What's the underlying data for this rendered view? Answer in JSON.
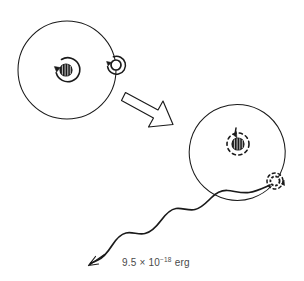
{
  "figure": {
    "kind": "atomic-transition-diagram",
    "background_color": "#ffffff",
    "ink_color": "#1a1a1a",
    "text_color": "#4a4a4a",
    "caption_label": "9.5 × 10",
    "caption_exponent": "−18",
    "caption_unit": " erg",
    "caption_full": "9.5 × 10−18 erg"
  },
  "initial_atom": {
    "name": "excited-atom",
    "orbit": {
      "cx": 67,
      "cy": 70,
      "r": 49
    },
    "nucleus": {
      "cx": 66,
      "cy": 70,
      "r": 6
    },
    "nucleus_spin_ring": {
      "cx": 66,
      "cy": 70,
      "r": 12
    },
    "electron": {
      "cx": 116,
      "cy": 65,
      "r": 5
    },
    "electron_spin_ring": {
      "cx": 116,
      "cy": 65,
      "r": 9
    },
    "style": "solid"
  },
  "final_atom": {
    "name": "ground-state-atom",
    "orbit": {
      "cx": 240,
      "cy": 150,
      "r": 48
    },
    "nucleus": {
      "cx": 238,
      "cy": 144,
      "r": 6
    },
    "nucleus_spin_ring": {
      "cx": 238,
      "cy": 144,
      "r": 11
    },
    "electron": {
      "cx": 275,
      "cy": 181,
      "r": 5
    },
    "electron_spin_ring": {
      "cx": 275,
      "cy": 181,
      "r": 8
    },
    "style": "dashed"
  },
  "transition_arrow": {
    "name": "block-arrow",
    "direction": "down-right",
    "from": {
      "x": 124,
      "y": 93
    },
    "to": {
      "x": 172,
      "y": 128
    }
  },
  "photon": {
    "name": "emitted-photon-wave",
    "start": {
      "x": 268,
      "y": 186
    },
    "end": {
      "x": 88,
      "y": 266
    },
    "waveform": "sinusoidal",
    "arrow_direction": "down-left"
  }
}
